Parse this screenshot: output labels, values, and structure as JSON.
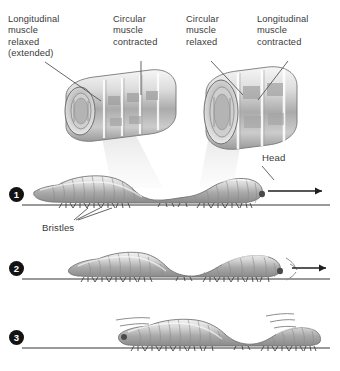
{
  "figure": {
    "background": "#ffffff"
  },
  "labels": {
    "longitudinal_relaxed": "Longitudinal\nmuscle\nrelaxed\n(extended)",
    "circular_contracted": "Circular\nmuscle\ncontracted",
    "circular_relaxed": "Circular\nmuscle\nrelaxed",
    "longitudinal_contracted": "Longitudinal\nmuscle\ncontracted",
    "head": "Head",
    "bristles": "Bristles"
  },
  "steps": [
    {
      "number": "1",
      "has_arrow": true,
      "has_motion_lines": false
    },
    {
      "number": "2",
      "has_arrow": true,
      "has_motion_lines": true
    },
    {
      "number": "3",
      "has_arrow": false,
      "has_motion_lines": true
    }
  ],
  "segments": {
    "left_cylinder": "extended-narrow-segment",
    "right_cylinder": "contracted-wide-segment"
  },
  "colors": {
    "body_light": "#e2e2e2",
    "body_mid": "#b9b9b9",
    "body_dark": "#8e8e8e",
    "outline": "#6d6d6d",
    "ground": "#9a9a9a",
    "cone": "#ededed",
    "leader": "#555555",
    "text": "#3a3a3a",
    "step_badge": "#131313"
  }
}
